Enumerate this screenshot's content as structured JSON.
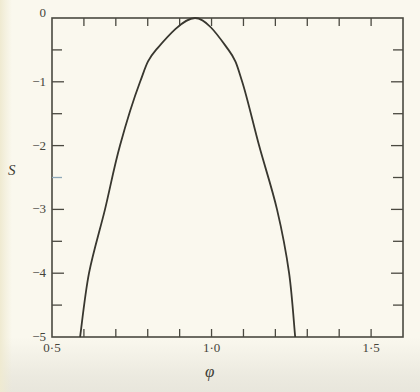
{
  "figure": {
    "xlabel": "φ",
    "ylabel": "S"
  },
  "colors": {
    "background": "#faf8ee",
    "frame": "#4a4940",
    "curve": "#38372f",
    "text": "#45443a",
    "accent_tick": "#8ea8b8"
  },
  "chart_data": {
    "type": "line",
    "xlabel": "φ",
    "ylabel": "S",
    "xlim": [
      0.5,
      1.6
    ],
    "ylim": [
      -5,
      0
    ],
    "grid": false,
    "legend": null,
    "x_ticks": {
      "minor_step": 0.1,
      "labeled": [
        {
          "value": 0.5,
          "label": "0·5"
        },
        {
          "value": 1.0,
          "label": "1·0"
        },
        {
          "value": 1.5,
          "label": "1·5"
        }
      ]
    },
    "y_ticks": {
      "minor_step": 0.5,
      "labeled": [
        {
          "value": 0,
          "label": "0"
        },
        {
          "value": -1,
          "label": "−1"
        },
        {
          "value": -2,
          "label": "−2"
        },
        {
          "value": -3,
          "label": "−3"
        },
        {
          "value": -4,
          "label": "−4"
        },
        {
          "value": -5,
          "label": "−5"
        }
      ]
    },
    "special_tick": {
      "axis": "y",
      "side": "left",
      "value": -2.5,
      "note": "blue-tinted tick (scan artifact)"
    },
    "series": [
      {
        "name": "S(φ)",
        "peak": [
          0.948,
          0
        ],
        "points": [
          [
            0.588,
            -5.0
          ],
          [
            0.616,
            -4.0
          ],
          [
            0.666,
            -3.0
          ],
          [
            0.713,
            -2.0
          ],
          [
            0.776,
            -1.0
          ],
          [
            0.826,
            -0.5
          ],
          [
            0.948,
            0.0
          ],
          [
            1.053,
            -0.5
          ],
          [
            1.096,
            -1.0
          ],
          [
            1.149,
            -2.0
          ],
          [
            1.205,
            -3.0
          ],
          [
            1.243,
            -4.0
          ],
          [
            1.262,
            -5.0
          ]
        ]
      }
    ]
  }
}
